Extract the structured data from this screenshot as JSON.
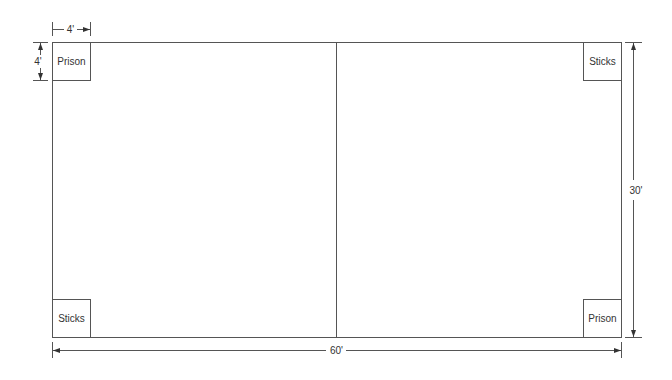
{
  "diagram": {
    "field": {
      "width_label": "60'",
      "height_label": "30'"
    },
    "box_dimensions": {
      "width_label": "4'",
      "height_label": "4'"
    },
    "boxes": [
      {
        "position": "top-left",
        "label": "Prison"
      },
      {
        "position": "top-right",
        "label": "Sticks"
      },
      {
        "position": "bottom-left",
        "label": "Sticks"
      },
      {
        "position": "bottom-right",
        "label": "Prison"
      }
    ]
  }
}
